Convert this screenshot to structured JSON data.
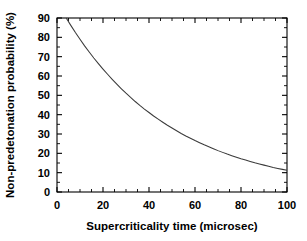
{
  "chart_data": {
    "type": "line",
    "title": "",
    "xlabel": "Supercriticality time (microsec)",
    "ylabel": "Non-predetonation probability (%)",
    "xlim": [
      0,
      100
    ],
    "ylim": [
      0,
      90
    ],
    "grid": false,
    "legend": null,
    "x_ticks": [
      0,
      20,
      40,
      60,
      80,
      100
    ],
    "x_tick_labels": [
      "0",
      "20",
      "40",
      "60",
      "80",
      "100"
    ],
    "x_minor_tick_step": 5,
    "y_ticks": [
      0,
      10,
      20,
      30,
      40,
      50,
      60,
      70,
      80,
      90
    ],
    "y_tick_labels": [
      "0",
      "10",
      "20",
      "30",
      "40",
      "50",
      "60",
      "70",
      "80",
      "90"
    ],
    "y_minor_tick_step": 5,
    "series": [
      {
        "name": "Non-predetonation probability",
        "color": "#3a3a3a",
        "x": [
          4,
          6,
          8,
          10,
          12,
          14,
          16,
          18,
          20,
          22,
          24,
          26,
          28,
          30,
          32,
          34,
          36,
          38,
          40,
          42,
          44,
          46,
          48,
          50,
          52,
          54,
          56,
          58,
          60,
          62,
          64,
          66,
          68,
          70,
          72,
          74,
          76,
          78,
          80,
          82,
          84,
          86,
          88,
          90,
          92,
          94,
          96,
          98,
          100
        ],
        "y": [
          90.0,
          86.2,
          82.5,
          79.0,
          75.6,
          72.4,
          69.3,
          66.4,
          63.6,
          60.9,
          58.3,
          55.8,
          53.4,
          51.1,
          48.9,
          46.8,
          44.8,
          42.9,
          41.1,
          39.3,
          37.7,
          36.1,
          34.5,
          33.1,
          31.7,
          30.3,
          29.0,
          27.8,
          26.6,
          25.5,
          24.4,
          23.4,
          22.4,
          21.4,
          20.5,
          19.6,
          18.8,
          18.0,
          17.2,
          16.5,
          15.8,
          15.1,
          14.5,
          13.9,
          13.3,
          12.7,
          12.2,
          11.7,
          11.2
        ]
      }
    ],
    "colors": {
      "axis": "#000000",
      "curve": "#3a3a3a",
      "background": "#ffffff"
    }
  }
}
